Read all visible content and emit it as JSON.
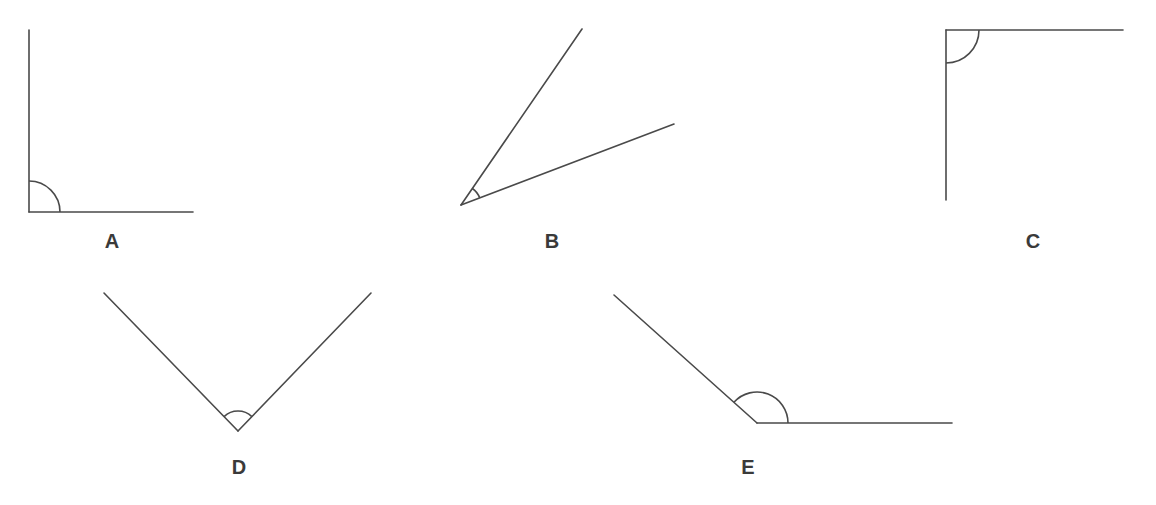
{
  "diagram": {
    "type": "angles",
    "stroke_color": "#4a4a4a",
    "label_color": "#3a3a3a",
    "figures": [
      {
        "id": "A",
        "label": "A",
        "kind": "right",
        "vertex": [
          29,
          212
        ],
        "ray1_end": [
          29,
          30
        ],
        "ray2_end": [
          193,
          212
        ],
        "arc_radius": 31,
        "label_pos": [
          112,
          248
        ]
      },
      {
        "id": "B",
        "label": "B",
        "kind": "acute",
        "vertex": [
          461,
          205
        ],
        "ray1_end": [
          582,
          29
        ],
        "ray2_end": [
          674,
          124
        ],
        "arc_radius": 20,
        "label_pos": [
          552,
          248
        ]
      },
      {
        "id": "C",
        "label": "C",
        "kind": "right",
        "vertex": [
          946,
          30
        ],
        "ray1_end": [
          1123,
          30
        ],
        "ray2_end": [
          946,
          200
        ],
        "arc_radius": 33,
        "label_pos": [
          1033,
          248
        ]
      },
      {
        "id": "D",
        "label": "D",
        "kind": "right",
        "vertex": [
          238,
          431
        ],
        "ray1_end": [
          104,
          293
        ],
        "ray2_end": [
          371,
          293
        ],
        "arc_radius": 20,
        "label_pos": [
          239,
          474
        ]
      },
      {
        "id": "E",
        "label": "E",
        "kind": "obtuse",
        "vertex": [
          757,
          423
        ],
        "ray1_end": [
          614,
          295
        ],
        "ray2_end": [
          952,
          423
        ],
        "arc_radius": 31,
        "label_pos": [
          748,
          474
        ]
      }
    ]
  }
}
